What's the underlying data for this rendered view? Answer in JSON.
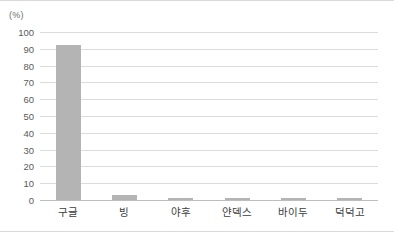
{
  "chart_data": {
    "type": "bar",
    "title": "",
    "subtitle": "",
    "xlabel": "",
    "ylabel": "(%)",
    "unit_label": "(%)",
    "categories": [
      "구글",
      "빙",
      "야후",
      "얀덱스",
      "바이두",
      "덕덕고"
    ],
    "values": [
      92,
      3,
      1,
      1,
      1,
      1
    ],
    "ylim": [
      0,
      100
    ],
    "ytick_values": [
      100,
      90,
      80,
      70,
      60,
      50,
      40,
      30,
      20,
      10,
      0
    ],
    "ytick_labels": [
      "100",
      "90",
      "80",
      "70",
      "60",
      "50",
      "40",
      "30",
      "20",
      "10",
      "0"
    ],
    "grid": true,
    "grid_axis": "y",
    "legend": false,
    "legend_position": "none",
    "orientation": "vertical",
    "colors": {
      "bar": "#b4b4b4",
      "gridline": "#dcdcdc",
      "baseline": "#bdbdbd",
      "tick_text": "#5a5a5a",
      "category_text": "#3d3d3d",
      "unit_text": "#6e6e6e",
      "background": "#ffffff",
      "frame_border": "#d9d9d9"
    }
  }
}
